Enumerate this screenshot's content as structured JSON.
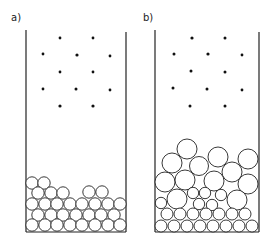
{
  "panels": [
    {
      "label": "a)",
      "description": "Container with dispersed dots above and a shallow bed of small, uniformly sized circles at the bottom"
    },
    {
      "label": "b)",
      "description": "Container with dispersed dots above and a deeper bed of mixed-size circles: small ones at the bottom, larger ones on top"
    }
  ],
  "colors": {
    "stroke": "#222222",
    "fill": "#ffffff",
    "dot": "#111111"
  }
}
